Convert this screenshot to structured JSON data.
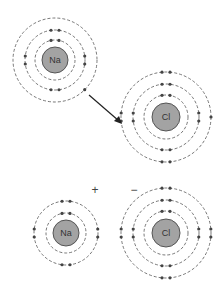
{
  "diagram": {
    "before": {
      "sodium": {
        "symbol": "Na",
        "shells": [
          2,
          8,
          1
        ]
      },
      "chlorine": {
        "symbol": "Cl",
        "shells": [
          2,
          8,
          7
        ]
      },
      "arrow": "electron transfer Na → Cl"
    },
    "after": {
      "sodium_ion": {
        "symbol": "Na",
        "charge": "+",
        "shells": [
          2,
          8
        ]
      },
      "chloride_ion": {
        "symbol": "Cl",
        "charge": "−",
        "shells": [
          2,
          8,
          8
        ]
      }
    }
  }
}
